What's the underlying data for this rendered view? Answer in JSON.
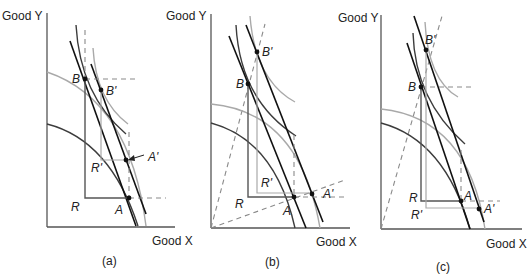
{
  "figure": {
    "panels": [
      {
        "id": "a",
        "caption": "(a)",
        "y_axis_label": "Good Y",
        "x_axis_label": "Good X",
        "points": {
          "B": "B",
          "B_prime": "B'",
          "A": "A",
          "A_prime": "A'",
          "R": "R",
          "R_prime": "R'"
        }
      },
      {
        "id": "b",
        "caption": "(b)",
        "y_axis_label": "Good Y",
        "x_axis_label": "Good X",
        "points": {
          "B": "B",
          "B_prime": "B'",
          "A": "A",
          "A_prime": "A'",
          "R": "R",
          "R_prime": "R'"
        }
      },
      {
        "id": "c",
        "caption": "(c)",
        "y_axis_label": "Good Y",
        "x_axis_label": "Good X",
        "points": {
          "B": "B",
          "B_prime": "B'",
          "A": "A",
          "A_prime": "A'",
          "R": "R",
          "R_prime": "R'"
        }
      }
    ],
    "colors": {
      "original_curves": "#3c3c3c",
      "shifted_curves": "#a9a9a9",
      "price_lines": "#111111",
      "guides": "#8a8a8a"
    }
  }
}
